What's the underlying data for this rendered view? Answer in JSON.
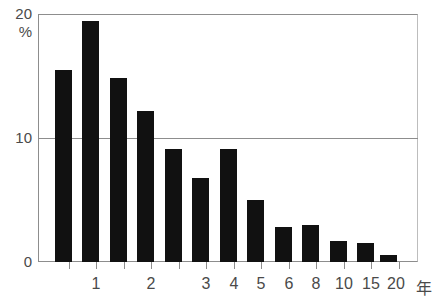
{
  "title": {
    "clipped_text": "─────────────────────────────"
  },
  "axis": {
    "y_top_label": "20",
    "y_unit_label": "%",
    "y_mid_label": "10",
    "y_zero_label": "0",
    "x_unit_label": "年"
  },
  "colors": {
    "bar": "#111111",
    "axis": "#8d8d8d",
    "grid": "#8d8d8d",
    "text": "#4a4a4a",
    "background": "#ffffff"
  },
  "chart_data": {
    "type": "bar",
    "title": "",
    "xlabel": "年",
    "ylabel": "%",
    "ylim": [
      0,
      20
    ],
    "yticks": [
      0,
      10,
      20
    ],
    "ytick_labels": [
      "0",
      "10",
      "20"
    ],
    "grid": true,
    "legend": "none",
    "categories": [
      "",
      "1",
      "",
      "2",
      "",
      "3",
      "4",
      "5",
      "6",
      "8",
      "10",
      "15",
      "20"
    ],
    "xtick_labels": [
      "1",
      "2",
      "3",
      "4",
      "5",
      "6",
      "8",
      "10",
      "15",
      "20",
      "年"
    ],
    "values": [
      15.5,
      19.4,
      14.8,
      12.2,
      9.1,
      6.8,
      9.1,
      5.0,
      2.8,
      3.0,
      1.7,
      1.5,
      0.6
    ],
    "bars": [
      {
        "index": 0,
        "value": 15.5,
        "x": 55,
        "width": 17
      },
      {
        "index": 1,
        "value": 19.4,
        "x": 82,
        "width": 17
      },
      {
        "index": 2,
        "value": 14.8,
        "x": 110,
        "width": 17
      },
      {
        "index": 3,
        "value": 12.2,
        "x": 137,
        "width": 17
      },
      {
        "index": 4,
        "value": 9.1,
        "x": 165,
        "width": 17
      },
      {
        "index": 5,
        "value": 6.8,
        "x": 192,
        "width": 17
      },
      {
        "index": 6,
        "value": 9.1,
        "x": 220,
        "width": 17
      },
      {
        "index": 7,
        "value": 5.0,
        "x": 247,
        "width": 17
      },
      {
        "index": 8,
        "value": 2.8,
        "x": 275,
        "width": 17
      },
      {
        "index": 9,
        "value": 3.0,
        "x": 302,
        "width": 17
      },
      {
        "index": 10,
        "value": 1.7,
        "x": 330,
        "width": 17
      },
      {
        "index": 11,
        "value": 1.5,
        "x": 357,
        "width": 17
      },
      {
        "index": 12,
        "value": 0.6,
        "x": 380,
        "width": 17
      }
    ],
    "ticks_x": [
      69,
      96,
      124,
      151,
      179,
      206,
      234,
      261,
      289,
      316,
      344,
      371,
      399
    ],
    "xtick_positions": [
      {
        "label": "1",
        "x": 96
      },
      {
        "label": "2",
        "x": 151
      },
      {
        "label": "3",
        "x": 206
      },
      {
        "label": "4",
        "x": 234
      },
      {
        "label": "5",
        "x": 261
      },
      {
        "label": "6",
        "x": 289
      },
      {
        "label": "8",
        "x": 316
      },
      {
        "label": "10",
        "x": 344
      },
      {
        "label": "15",
        "x": 371
      },
      {
        "label": "20",
        "x": 396
      },
      {
        "label": "年",
        "x": 424
      }
    ]
  }
}
